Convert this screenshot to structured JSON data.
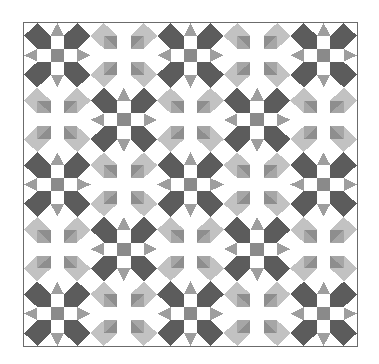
{
  "title": "Star quilt pattern",
  "quilt": {
    "rows": 5,
    "cols": 5,
    "layout": "checkerboard",
    "first_block": "star",
    "units_per_block": 5,
    "colors": {
      "background": "#ffffff",
      "star_dark": "#5c5c5c",
      "star_center": "#8a8a8a",
      "star_points": "#9e9e9e",
      "hst_light": "#c2c2c2",
      "hst_medium": "#a6a6a6",
      "hst_dark": "#8e8e8e",
      "border": "#6b6b6b"
    },
    "blocks": {
      "star": "dark star block with gray center square and four gray triangle points",
      "cross": "light block of half-square triangles with white cross sashing"
    }
  }
}
